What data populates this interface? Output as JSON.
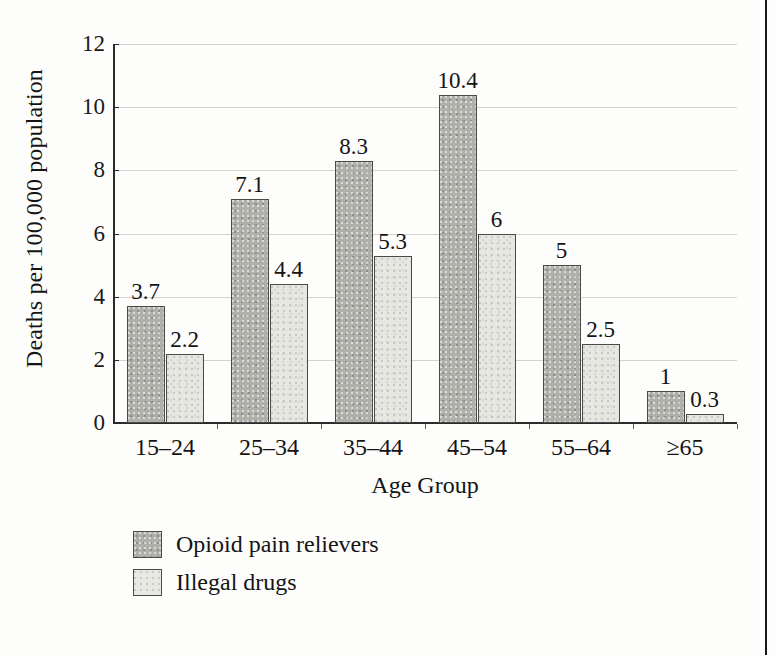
{
  "chart_data": {
    "type": "bar",
    "title": "",
    "xlabel": "Age Group",
    "ylabel": "Deaths per 100,000 population",
    "categories": [
      "15–24",
      "25–34",
      "35–44",
      "45–54",
      "55–64",
      "≥65"
    ],
    "series": [
      {
        "name": "Opioid pain relievers",
        "color": "#b0b0ab",
        "values": [
          3.7,
          7.1,
          8.3,
          10.4,
          5,
          1
        ],
        "value_labels": [
          "3.7",
          "7.1",
          "8.3",
          "10.4",
          "5",
          "1"
        ]
      },
      {
        "name": "Illegal drugs",
        "color": "#e7e7e2",
        "values": [
          2.2,
          4.4,
          5.3,
          6,
          2.5,
          0.3
        ],
        "value_labels": [
          "2.2",
          "4.4",
          "5.3",
          "6",
          "2.5",
          "0.3"
        ]
      }
    ],
    "ylim": [
      0,
      12
    ],
    "yticks": [
      0,
      2,
      4,
      6,
      8,
      10,
      12
    ],
    "ytick_labels": [
      "0",
      "2",
      "4",
      "6",
      "8",
      "10",
      "12"
    ],
    "grid": true,
    "grid_axis": "y",
    "legend_position": "below-left"
  },
  "legend": {
    "items": [
      {
        "label": "Opioid pain relievers",
        "swatch": "opioid"
      },
      {
        "label": "Illegal drugs",
        "swatch": "illegal"
      }
    ]
  },
  "axes": {
    "y_title": "Deaths per 100,000 population",
    "x_title": "Age Group"
  }
}
